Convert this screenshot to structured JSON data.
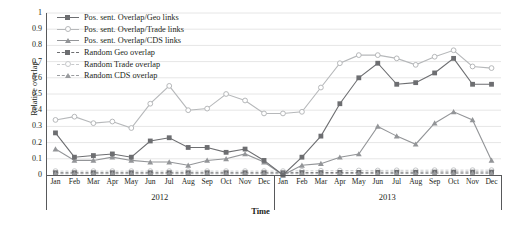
{
  "chart_data": {
    "type": "line",
    "title": "",
    "xlabel": "Time",
    "ylabel": "Relative overlap",
    "ylim": [
      0,
      1
    ],
    "yticks": [
      "0",
      "0.1",
      "0.2",
      "0.3",
      "0.4",
      "0.5",
      "0.6",
      "0.7",
      "0.8",
      "0.9",
      "1"
    ],
    "grid": true,
    "legend_position": "top-left",
    "categories": [
      "Jan",
      "Feb",
      "Mar",
      "Apr",
      "May",
      "Jun",
      "Jul",
      "Aug",
      "Sep",
      "Oct",
      "Nov",
      "Dec",
      "Jan",
      "Feb",
      "Mar",
      "Apr",
      "May",
      "Jun",
      "Jul",
      "Aug",
      "Sep",
      "Oct",
      "Nov",
      "Dec"
    ],
    "year_groups": [
      {
        "label": "2012",
        "start": 0,
        "end": 11
      },
      {
        "label": "2013",
        "start": 12,
        "end": 23
      }
    ],
    "series": [
      {
        "name": "Pos. sent. Overlap/Geo links",
        "color": "#6d6e71",
        "marker": "square",
        "dashed": false,
        "values": [
          0.26,
          0.11,
          0.12,
          0.13,
          0.11,
          0.21,
          0.23,
          0.17,
          0.17,
          0.14,
          0.16,
          0.09,
          0.0,
          0.11,
          0.24,
          0.44,
          0.6,
          0.69,
          0.56,
          0.57,
          0.63,
          0.72,
          0.56,
          0.56
        ]
      },
      {
        "name": "Pos. sent. Overlap/Trade links",
        "color": "#b6b8ba",
        "marker": "circle",
        "dashed": false,
        "values": [
          0.34,
          0.36,
          0.32,
          0.33,
          0.29,
          0.44,
          0.55,
          0.4,
          0.41,
          0.5,
          0.46,
          0.38,
          0.38,
          0.39,
          0.54,
          0.69,
          0.74,
          0.74,
          0.72,
          0.68,
          0.73,
          0.77,
          0.67,
          0.66
        ]
      },
      {
        "name": "Pos. sent. Overlap/CDS links",
        "color": "#939598",
        "marker": "triangle",
        "dashed": false,
        "values": [
          0.16,
          0.09,
          0.09,
          0.11,
          0.09,
          0.08,
          0.08,
          0.06,
          0.09,
          0.1,
          0.13,
          0.08,
          0.0,
          0.06,
          0.07,
          0.11,
          0.13,
          0.3,
          0.24,
          0.19,
          0.32,
          0.39,
          0.34,
          0.09
        ]
      },
      {
        "name": "Random Geo overlap",
        "color": "#6d6e71",
        "marker": "square",
        "dashed": true,
        "values": [
          0.014,
          0.014,
          0.014,
          0.014,
          0.014,
          0.014,
          0.014,
          0.014,
          0.014,
          0.014,
          0.014,
          0.014,
          0.014,
          0.015,
          0.015,
          0.016,
          0.016,
          0.017,
          0.017,
          0.017,
          0.018,
          0.018,
          0.018,
          0.018
        ]
      },
      {
        "name": "Random Trade overlap",
        "color": "#c7c9cb",
        "marker": "circle",
        "dashed": true,
        "values": [
          0.024,
          0.024,
          0.024,
          0.024,
          0.024,
          0.024,
          0.024,
          0.024,
          0.024,
          0.024,
          0.024,
          0.024,
          0.024,
          0.026,
          0.026,
          0.027,
          0.028,
          0.028,
          0.029,
          0.029,
          0.03,
          0.03,
          0.03,
          0.03
        ]
      },
      {
        "name": "Random CDS overlap",
        "color": "#9a9c9f",
        "marker": "triangle",
        "dashed": true,
        "values": [
          0.008,
          0.008,
          0.008,
          0.008,
          0.008,
          0.008,
          0.008,
          0.008,
          0.008,
          0.008,
          0.008,
          0.008,
          0.008,
          0.008,
          0.008,
          0.009,
          0.009,
          0.009,
          0.009,
          0.009,
          0.01,
          0.01,
          0.01,
          0.01
        ]
      }
    ]
  }
}
